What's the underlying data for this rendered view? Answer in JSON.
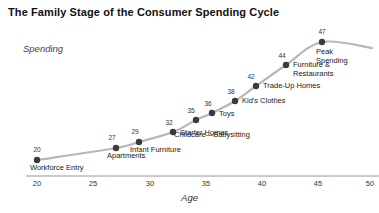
{
  "chart_data": {
    "type": "line",
    "title": "The Family Stage of the Consumer Spending Cycle",
    "xlabel": "Age",
    "ylabel": "Spending",
    "xlim": [
      20,
      51
    ],
    "ylim": [
      0,
      50
    ],
    "grid": false,
    "legend": null,
    "xticks": [
      20,
      25,
      30,
      35,
      40,
      45,
      50
    ],
    "xtick_labels": [
      "20",
      "25",
      "30",
      "35",
      "40",
      "45",
      "50"
    ],
    "x": [
      20,
      27,
      29,
      32,
      35,
      36,
      38,
      42,
      44,
      47
    ],
    "point_labels": [
      "Workforce Entry",
      "Apartments",
      "Infant Furniture",
      "Starter Homes",
      "Childcare—Babysitting",
      "Toys",
      "Kid's Clothes",
      "Trade-Up Homes",
      "Furniture &\nRestaurants",
      "Peak\nSpending"
    ],
    "value_labels": [
      "20",
      "27",
      "29",
      "32",
      "35",
      "36",
      "38",
      "42",
      "44",
      "47"
    ],
    "series": [
      {
        "name": "Spending",
        "values": [
          20,
          27,
          29,
          32,
          35,
          36,
          38,
          42,
          44,
          47
        ]
      }
    ]
  },
  "points": [
    {
      "value": "20",
      "label": "Workforce Entry",
      "label2": "",
      "px": 37,
      "py": 160,
      "vx": 37,
      "vy": 146,
      "lx": 30,
      "ly": 164
    },
    {
      "value": "27",
      "label": "Apartments",
      "label2": "",
      "px": 116,
      "py": 148,
      "vx": 112,
      "vy": 134,
      "lx": 107,
      "ly": 152
    },
    {
      "value": "29",
      "label": "Infant Furniture",
      "label2": "",
      "px": 139,
      "py": 142,
      "vx": 135,
      "vy": 128,
      "lx": 130,
      "ly": 146
    },
    {
      "value": "32",
      "label": "Starter Homes",
      "label2": "",
      "px": 173,
      "py": 132,
      "vx": 169,
      "vy": 119,
      "lx": 180,
      "ly": 129
    },
    {
      "value": "35",
      "label": "Childcare—Babysitting",
      "label2": "",
      "px": 196,
      "py": 120,
      "vx": 191,
      "vy": 107,
      "lx": 174,
      "ly": 131
    },
    {
      "value": "36",
      "label": "Toys",
      "label2": "",
      "px": 212,
      "py": 113,
      "vx": 208,
      "vy": 100,
      "lx": 219,
      "ly": 110
    },
    {
      "value": "38",
      "label": "Kid's Clothes",
      "label2": "",
      "px": 235,
      "py": 101,
      "vx": 231,
      "vy": 88,
      "lx": 242,
      "ly": 97
    },
    {
      "value": "42",
      "label": "Trade-Up Homes",
      "label2": "",
      "px": 256,
      "py": 86,
      "vx": 251,
      "vy": 73,
      "lx": 263,
      "ly": 82
    },
    {
      "value": "44",
      "label": "Furniture &",
      "label2": "Restaurants",
      "px": 286,
      "py": 65,
      "vx": 282,
      "vy": 52,
      "lx": 293,
      "ly": 61
    },
    {
      "value": "47",
      "label": "Peak",
      "label2": "Spending",
      "px": 322,
      "py": 42,
      "vx": 322,
      "vy": 28,
      "lx": 316,
      "ly": 48
    }
  ],
  "axis": {
    "ticks": [
      {
        "label": "20",
        "x": 37
      },
      {
        "label": "25",
        "x": 93
      },
      {
        "label": "30",
        "x": 150
      },
      {
        "label": "35",
        "x": 206
      },
      {
        "label": "40",
        "x": 262
      },
      {
        "label": "45",
        "x": 318
      },
      {
        "label": "50",
        "x": 370
      }
    ],
    "line_y": 176,
    "line_x1": 26,
    "line_x2": 379
  },
  "colors": {
    "line": "#b7b7b7",
    "dot": "#3b3b3b",
    "axis": "#8a8a8a",
    "text": "#1a1a1a",
    "title": "#111111"
  },
  "credit": ""
}
